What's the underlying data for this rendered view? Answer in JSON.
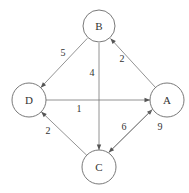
{
  "diagram": {
    "type": "directed-weighted-graph",
    "nodes": [
      {
        "id": "A",
        "label": "A"
      },
      {
        "id": "B",
        "label": "B"
      },
      {
        "id": "C",
        "label": "C"
      },
      {
        "id": "D",
        "label": "D"
      }
    ],
    "edges": [
      {
        "from": "B",
        "to": "D",
        "weight": "5"
      },
      {
        "from": "B",
        "to": "C",
        "weight": "4"
      },
      {
        "from": "A",
        "to": "B",
        "weight": "2"
      },
      {
        "from": "D",
        "to": "A",
        "weight": "1"
      },
      {
        "from": "C",
        "to": "D",
        "weight": "2"
      },
      {
        "from": "C",
        "to": "A",
        "weight": "6"
      },
      {
        "from": "A",
        "to": "C",
        "weight": "9"
      }
    ]
  }
}
